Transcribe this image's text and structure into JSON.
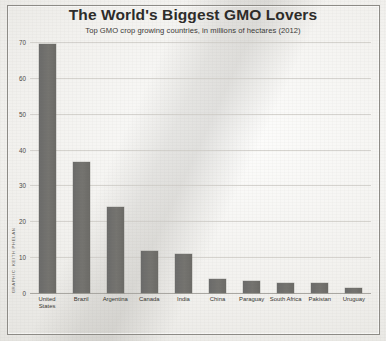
{
  "credit": "GRAPHIC: KEITH PHELAN",
  "chart_data": {
    "type": "bar",
    "title": "The World's Biggest GMO Lovers",
    "subtitle": "Top GMO crop growing countries, in millions of hectares (2012)",
    "xlabel": "",
    "ylabel": "",
    "ylim": [
      0,
      70
    ],
    "yticks": [
      0,
      10,
      20,
      30,
      40,
      50,
      60,
      70
    ],
    "ytick_labels": [
      "0",
      "10",
      "20",
      "30",
      "40",
      "50",
      "60",
      "70"
    ],
    "grid": true,
    "legend": false,
    "bar_color": "#6f6e6b",
    "categories": [
      "United States",
      "Brazil",
      "Argentina",
      "Canada",
      "India",
      "China",
      "Paraguay",
      "South Africa",
      "Pakistan",
      "Uruguay"
    ],
    "values": [
      69.5,
      36.6,
      23.9,
      11.6,
      10.8,
      4.0,
      3.4,
      2.9,
      2.8,
      1.4
    ]
  }
}
